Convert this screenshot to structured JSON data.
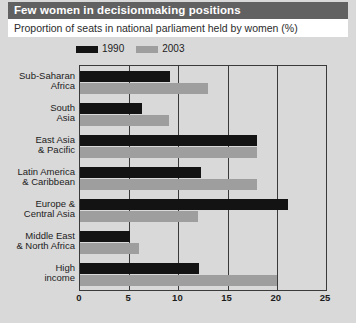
{
  "title": "Few women in decisionmaking positions",
  "subtitle": "Proportion of seats in national parliament held by women (%)",
  "legend": [
    {
      "label": "1990",
      "color": "#131313",
      "name": "legend-1990"
    },
    {
      "label": "2003",
      "color": "#9e9e9e",
      "name": "legend-2003"
    }
  ],
  "colors": {
    "series_1990": "#131313",
    "series_2003": "#9e9e9e",
    "title_band": "#616161",
    "subtitle_band": "#ffffff",
    "page_background": "#d9d9d9",
    "axis": "#3a3a3a"
  },
  "chart_data": {
    "type": "bar",
    "orientation": "horizontal",
    "title": "Few women in decisionmaking positions",
    "subtitle": "Proportion of seats in national parliament held by women (%)",
    "xlabel": "",
    "ylabel": "",
    "xlim": [
      0,
      25
    ],
    "xticks": [
      0,
      5,
      10,
      15,
      20,
      25
    ],
    "xtick_labels": [
      "0",
      "5",
      "10",
      "15",
      "20",
      "25"
    ],
    "grid": true,
    "grid_axis": "x",
    "legend_position": "top-left",
    "categories": [
      "Sub-Saharan Africa",
      "South Asia",
      "East Asia & Pacific",
      "Latin America & Caribbean",
      "Europe & Central Asia",
      "Middle East & North Africa",
      "High income"
    ],
    "category_lines": [
      [
        "Sub-Saharan",
        "Africa"
      ],
      [
        "South",
        "Asia"
      ],
      [
        "East Asia",
        "& Pacific"
      ],
      [
        "Latin America",
        "& Caribbean"
      ],
      [
        "Europe &",
        "Central Asia"
      ],
      [
        "Middle East",
        "& North Africa"
      ],
      [
        "High",
        "income"
      ]
    ],
    "series": [
      {
        "name": "1990",
        "color": "#131313",
        "values": [
          9.1,
          6.3,
          18.0,
          12.3,
          21.1,
          5.1,
          12.1
        ]
      },
      {
        "name": "2003",
        "color": "#9e9e9e",
        "values": [
          13.0,
          9.0,
          18.0,
          18.0,
          12.0,
          6.0,
          20.0
        ]
      }
    ]
  }
}
